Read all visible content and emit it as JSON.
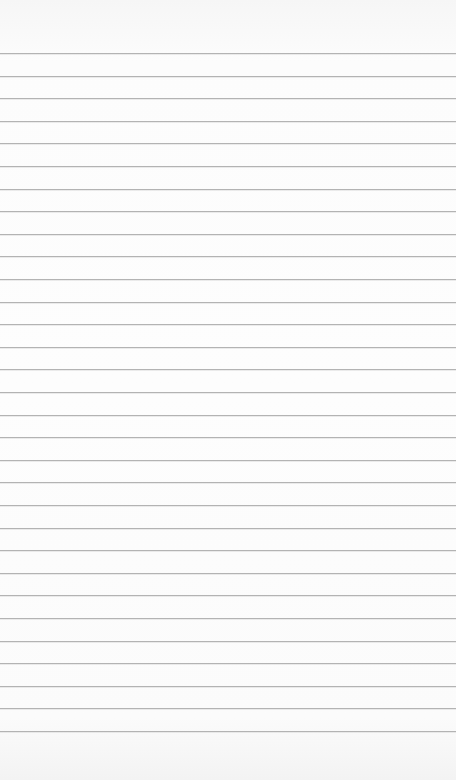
{
  "page": {
    "type": "lined-paper",
    "background_color": "#fafafa",
    "line_color": "#b3b3b3",
    "line_count": 31,
    "first_line_y": 53,
    "line_spacing": 22.6,
    "text_content": []
  }
}
